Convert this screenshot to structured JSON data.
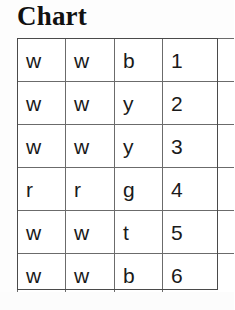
{
  "title": "Chart",
  "colors": {
    "background": "#fdfdfd",
    "cell_background": "#ffffff",
    "border": "#6b6b6b",
    "frame": "#4a4a4a",
    "text": "#1a1a1a",
    "title_text": "#111111"
  },
  "table": {
    "rows": 6,
    "columns": 4,
    "has_header_row": false,
    "cells": [
      [
        "w",
        "w",
        "b",
        "1"
      ],
      [
        "w",
        "w",
        "y",
        "2"
      ],
      [
        "w",
        "w",
        "y",
        "3"
      ],
      [
        "r",
        "r",
        "g",
        "4"
      ],
      [
        "w",
        "w",
        "t",
        "5"
      ],
      [
        "w",
        "w",
        "b",
        "6"
      ]
    ]
  },
  "chart_data": {
    "type": "table",
    "title": "Chart",
    "columns": [
      "col1",
      "col2",
      "col3",
      "col4"
    ],
    "rows": [
      [
        "w",
        "w",
        "b",
        "1"
      ],
      [
        "w",
        "w",
        "y",
        "2"
      ],
      [
        "w",
        "w",
        "y",
        "3"
      ],
      [
        "r",
        "r",
        "g",
        "4"
      ],
      [
        "w",
        "w",
        "t",
        "5"
      ],
      [
        "w",
        "w",
        "b",
        "6"
      ]
    ],
    "xlabel": "",
    "ylabel": "",
    "grid": true,
    "legend": ""
  }
}
